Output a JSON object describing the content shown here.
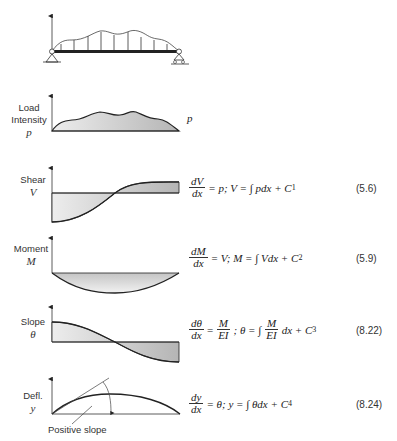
{
  "beam": {
    "description": "simply supported beam with distributed upward load"
  },
  "panels": [
    {
      "id": "load",
      "label_line1": "Load",
      "label_line2": "Intensity",
      "symbol": "p",
      "right_symbol": "p"
    },
    {
      "id": "shear",
      "label_line1": "Shear",
      "symbol": "V",
      "eq": {
        "num": "dV",
        "den": "dx",
        "rhs": "= p; V = ∫ pdx + C",
        "sub": "1"
      },
      "eq_number": "(5.6)"
    },
    {
      "id": "moment",
      "label_line1": "Moment",
      "symbol": "M",
      "eq": {
        "num": "dM",
        "den": "dx",
        "rhs": "= V; M = ∫ Vdx + C",
        "sub": "2"
      },
      "eq_number": "(5.9)"
    },
    {
      "id": "slope",
      "label_line1": "Slope",
      "symbol": "θ",
      "eq": {
        "num": "dθ",
        "den": "dx",
        "mid_num": "M",
        "mid_den": "EI",
        "rhs1": "; θ = ∫",
        "int_num": "M",
        "int_den": "EI",
        "rhs2": "dx + C",
        "sub": "3"
      },
      "eq_number": "(8.22)"
    },
    {
      "id": "deflection",
      "label_line1": "Defl.",
      "symbol": "y",
      "eq": {
        "num": "dy",
        "den": "dx",
        "rhs": "= θ; y = ∫ θdx + C",
        "sub": "4"
      },
      "eq_number": "(8.24)",
      "annotation": "Positive slope"
    }
  ],
  "colors": {
    "fill_light": "#f2f2f2",
    "fill_dark": "#b8b8b8",
    "stroke": "#222222"
  }
}
